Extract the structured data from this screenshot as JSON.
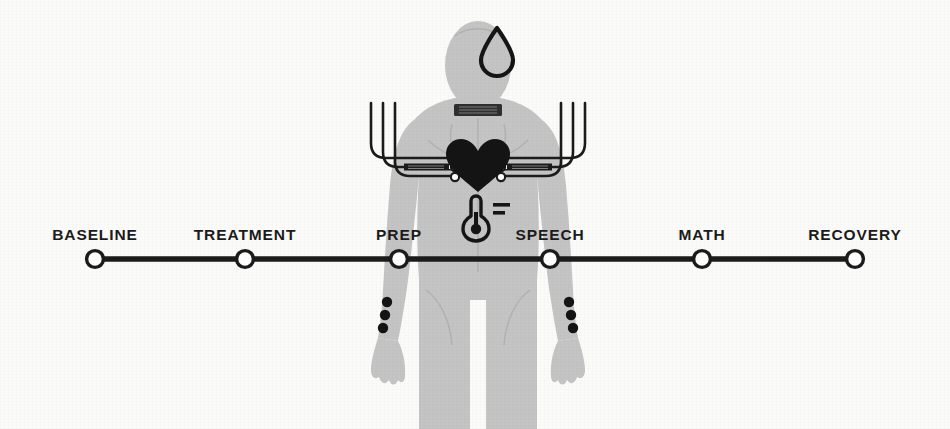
{
  "figure": {
    "name": "psychophysiology-stress-protocol-timeline",
    "background_color": "#fbfbf9",
    "ink_color": "#1b1b1b",
    "body_fill_color": "#c4c4c4",
    "body_outline_color": "#b0b0b0"
  },
  "timeline": {
    "axis_y": 259,
    "line_color": "#1b1b1b",
    "node_fill_color": "#ffffff",
    "node_stroke_color": "#1b1b1b",
    "start_x": 95,
    "end_x": 855,
    "stages": [
      {
        "label": "BASELINE",
        "x": 95,
        "label_y": 226
      },
      {
        "label": "TREATMENT",
        "x": 245,
        "label_y": 226
      },
      {
        "label": "PREP",
        "x": 399,
        "label_y": 226
      },
      {
        "label": "SPEECH",
        "x": 550,
        "label_y": 226
      },
      {
        "label": "MATH",
        "x": 702,
        "label_y": 226
      },
      {
        "label": "RECOVERY",
        "x": 855,
        "label_y": 226
      }
    ]
  },
  "body_figure": {
    "name": "human-torso-silhouette",
    "sensors": [
      {
        "name": "sweat-drop-icon",
        "label": "perspiration sensor",
        "x": 497,
        "y": 52
      },
      {
        "name": "neck-collar-band",
        "label": "neck band",
        "x": 478,
        "y": 110
      },
      {
        "name": "heart-icon",
        "label": "heart",
        "x": 478,
        "y": 165
      },
      {
        "name": "ecg-electrodes-left",
        "label": "ECG electrodes left",
        "count": 3
      },
      {
        "name": "ecg-electrodes-right",
        "label": "ECG electrodes right",
        "count": 3
      },
      {
        "name": "thermometer-icon",
        "label": "temperature sensor",
        "x": 476,
        "y": 216
      },
      {
        "name": "wrist-sensors-left",
        "label": "left wrist sensors",
        "count": 3
      },
      {
        "name": "wrist-sensors-right",
        "label": "right wrist sensors",
        "count": 3
      }
    ]
  }
}
